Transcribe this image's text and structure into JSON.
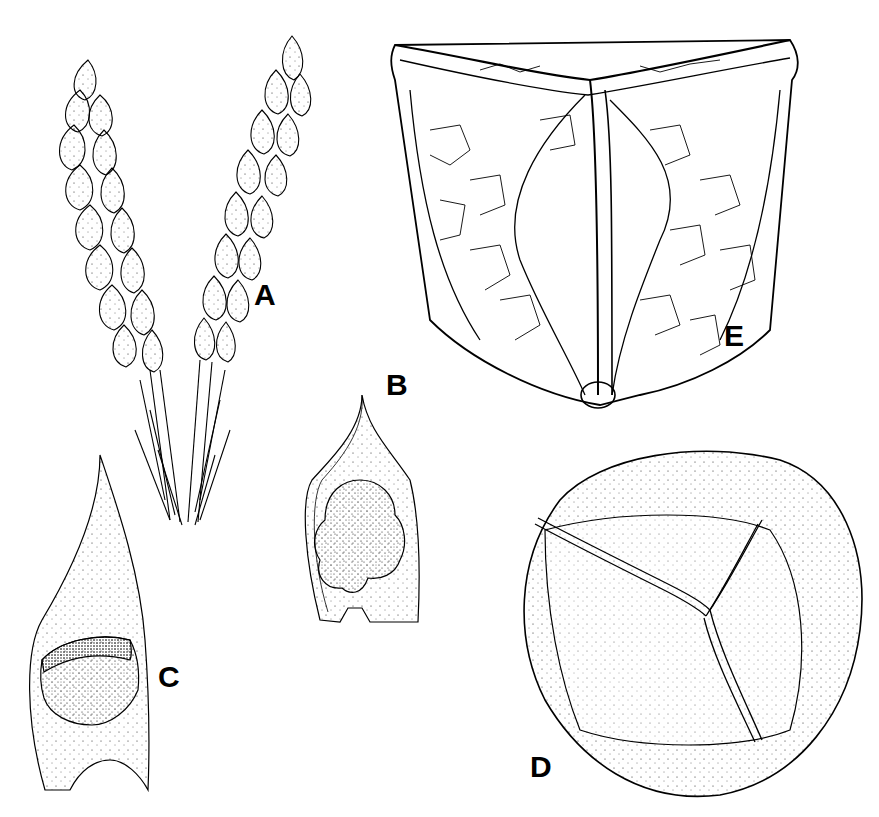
{
  "figure": {
    "panels": [
      {
        "id": "A",
        "label": "A",
        "description": "branching shoot with imbricate leaves"
      },
      {
        "id": "B",
        "label": "B",
        "description": "sporophyll with sporangium"
      },
      {
        "id": "C",
        "label": "C",
        "description": "sporophyll with sporangium, side view"
      },
      {
        "id": "D",
        "label": "D",
        "description": "spore, proximal view with trilete mark"
      },
      {
        "id": "E",
        "label": "E",
        "description": "spore, tetrahedral view with reticulate sculpture"
      }
    ]
  }
}
